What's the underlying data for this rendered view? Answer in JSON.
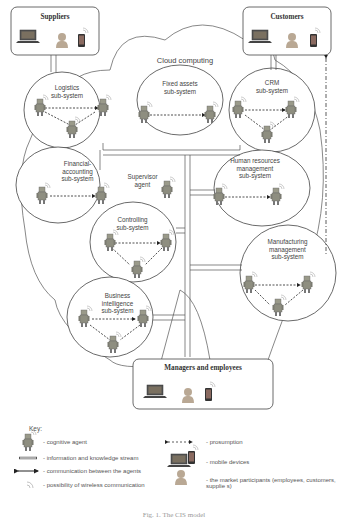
{
  "diagram": {
    "cloud_label": "Cloud computing",
    "external_boxes": [
      {
        "id": "suppliers",
        "title": "Suppliers"
      },
      {
        "id": "customers",
        "title": "Customers"
      },
      {
        "id": "managers",
        "title": "Managers and employees"
      }
    ],
    "subsystems": [
      {
        "id": "logistics",
        "label_line1": "Logistics",
        "label_line2": "sub-system",
        "agents": 3
      },
      {
        "id": "fixed-assets",
        "label_line1": "Fixed assets",
        "label_line2": "sub-system",
        "agents": 2
      },
      {
        "id": "crm",
        "label_line1": "CRM",
        "label_line2": "sub-system",
        "agents": 3
      },
      {
        "id": "financial",
        "label_line1": "Financial-",
        "label_line2": "accounting",
        "label_line3": "sub-system",
        "agents": 2
      },
      {
        "id": "hr",
        "label_line1": "Human resources",
        "label_line2": "management",
        "label_line3": "sub-system",
        "agents": 2
      },
      {
        "id": "controlling",
        "label_line1": "Controlling",
        "label_line2": "sub-system",
        "agents": 3
      },
      {
        "id": "manufacturing",
        "label_line1": "Manufacturing",
        "label_line2": "management",
        "label_line3": "sub-system",
        "agents": 3
      },
      {
        "id": "bi",
        "label_line1": "Business",
        "label_line2": "intelligence",
        "label_line3": "sub-system",
        "agents": 3
      }
    ],
    "supervisor": {
      "label_line1": "Supervisor",
      "label_line2": "agent"
    }
  },
  "key": {
    "title": "Key:",
    "items": [
      {
        "icon": "robot-icon",
        "text": "- cognitive agent"
      },
      {
        "icon": "double-arrow-hollow-icon",
        "text": "- information and knowledge stream"
      },
      {
        "icon": "double-arrow-solid-icon",
        "text": "- communication between the agents"
      },
      {
        "icon": "wireless-icon",
        "text": "- possibility of wireless communication"
      },
      {
        "icon": "dashed-arrow-icon",
        "text": "- prosumption"
      },
      {
        "icon": "devices-icon",
        "text": "- mobile devices"
      },
      {
        "icon": "person-icon",
        "text": "- the market participants (employees, customers,",
        "text2": "supplie s)"
      }
    ]
  },
  "caption": "Fig. 1. The CIS model"
}
